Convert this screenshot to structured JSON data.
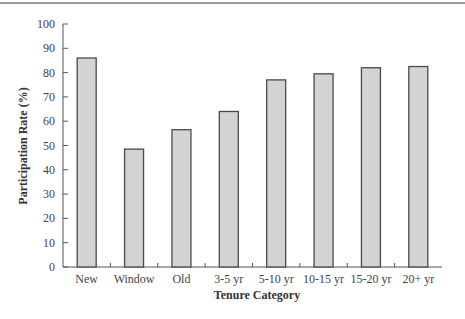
{
  "chart_data": {
    "type": "bar",
    "title": "",
    "xlabel": "Tenure Category",
    "ylabel": "Participation Rate (%)",
    "categories": [
      "New",
      "Window",
      "Old",
      "3-5 yr",
      "5-10 yr",
      "10-15 yr",
      "15-20 yr",
      "20+ yr"
    ],
    "values": [
      86,
      48.5,
      56.5,
      64,
      77,
      79.5,
      82,
      82.5
    ],
    "ylim": [
      0,
      100
    ],
    "yticks": [
      0,
      10,
      20,
      30,
      40,
      50,
      60,
      70,
      80,
      90,
      100
    ],
    "grid": false,
    "legend": null,
    "colors": {
      "bar_fill": "#d3d3d3",
      "bar_stroke": "#4a4a4a",
      "axis": "#555555"
    }
  }
}
